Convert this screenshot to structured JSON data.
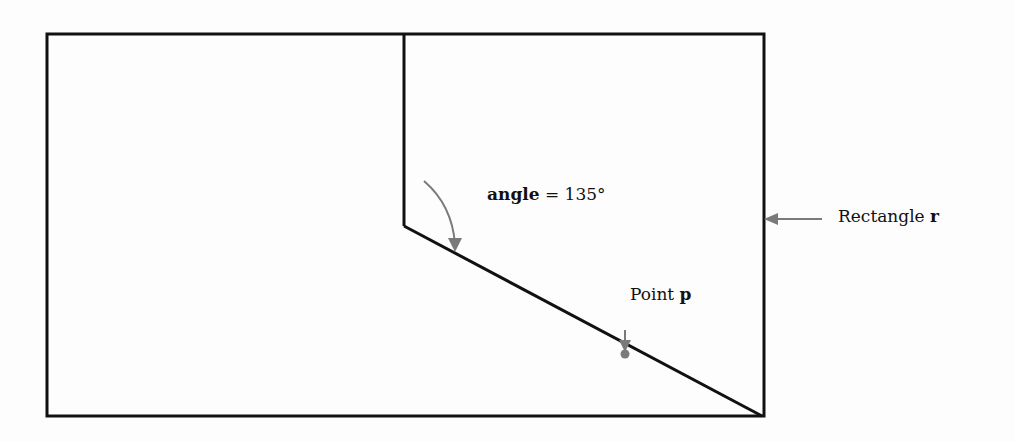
{
  "diagram": {
    "rectangle_label": {
      "text": "Rectangle ",
      "var": "r"
    },
    "angle_label": {
      "var": "angle",
      "text": " = 135°"
    },
    "point_label": {
      "text": "Point ",
      "var": "p"
    },
    "colors": {
      "line": "#111111",
      "arrow": "#7a7a7a",
      "point": "#7a7a7a",
      "background": "#fdfdfd"
    },
    "geometry": {
      "rectangle": {
        "x": 47,
        "y": 34,
        "width": 717,
        "height": 382
      },
      "vertical_segment": {
        "x": 404,
        "y1": 34,
        "y2": 226
      },
      "diagonal_segment": {
        "x1": 404,
        "y1": 226,
        "x2": 762,
        "y2": 416
      },
      "angle_degrees": 135,
      "point_p": {
        "x": 625,
        "y": 354
      }
    }
  }
}
